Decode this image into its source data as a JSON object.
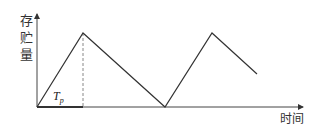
{
  "diagram": {
    "y_axis_label": [
      "存",
      "贮",
      "量"
    ],
    "x_axis_label": "时间",
    "period_label": {
      "main": "T",
      "sub": "p"
    },
    "colors": {
      "line": "#333333",
      "axis": "#444444",
      "dashed": "#888888"
    },
    "curve_points": [
      [
        37,
        107
      ],
      [
        83,
        33
      ],
      [
        165,
        107
      ],
      [
        212,
        33
      ],
      [
        257,
        74
      ]
    ]
  }
}
